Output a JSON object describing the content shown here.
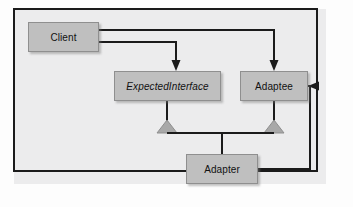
{
  "diagram": {
    "panel_color": "#ececed",
    "node_fill": "#bfbfbf",
    "node_stroke": "#8f8f8f",
    "line_color": "#1b1b1b",
    "triangle_fill": "#a8a8a8",
    "nodes": [
      {
        "id": "client",
        "label": "Client",
        "abstract": false,
        "x": 28,
        "y": 22,
        "w": 71,
        "h": 30
      },
      {
        "id": "expected_interface",
        "label": "ExpectedInterface",
        "abstract": true,
        "x": 114,
        "y": 71,
        "w": 107,
        "h": 30
      },
      {
        "id": "adaptee",
        "label": "Adaptee",
        "abstract": false,
        "x": 240,
        "y": 71,
        "w": 68,
        "h": 30
      },
      {
        "id": "adapter",
        "label": "Adapter",
        "abstract": false,
        "x": 186,
        "y": 154,
        "w": 72,
        "h": 30
      }
    ],
    "edges": [
      {
        "id": "client-to-expected-interface",
        "type": "dependency",
        "from": "client",
        "to": "expected_interface",
        "arrow": "open-solid-head"
      },
      {
        "id": "client-to-adaptee",
        "type": "dependency",
        "from": "client",
        "to": "adaptee",
        "arrow": "open-solid-head"
      },
      {
        "id": "adapter-to-expected-interface",
        "type": "generalization",
        "from": "adapter",
        "to": "expected_interface",
        "arrow": "hollow-triangle"
      },
      {
        "id": "adapter-to-adaptee-inherit",
        "type": "generalization",
        "from": "adapter",
        "to": "adaptee",
        "arrow": "hollow-triangle"
      },
      {
        "id": "adapter-to-adaptee-assoc",
        "type": "association",
        "from": "adapter",
        "to": "adaptee",
        "arrow": "open-solid-head"
      }
    ]
  }
}
